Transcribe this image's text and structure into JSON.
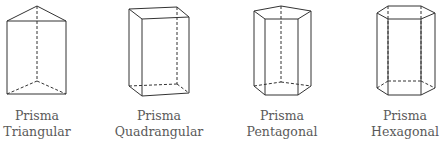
{
  "figure": {
    "stroke_color": "#333333",
    "label_color": "#5a5a5a",
    "prisms": [
      {
        "line1": "Prisma",
        "line2": "Triangular",
        "base_sides": 3
      },
      {
        "line1": "Prisma",
        "line2": "Quadrangular",
        "base_sides": 4
      },
      {
        "line1": "Prisma",
        "line2": "Pentagonal",
        "base_sides": 5
      },
      {
        "line1": "Prisma",
        "line2": "Hexagonal",
        "base_sides": 6
      }
    ]
  }
}
